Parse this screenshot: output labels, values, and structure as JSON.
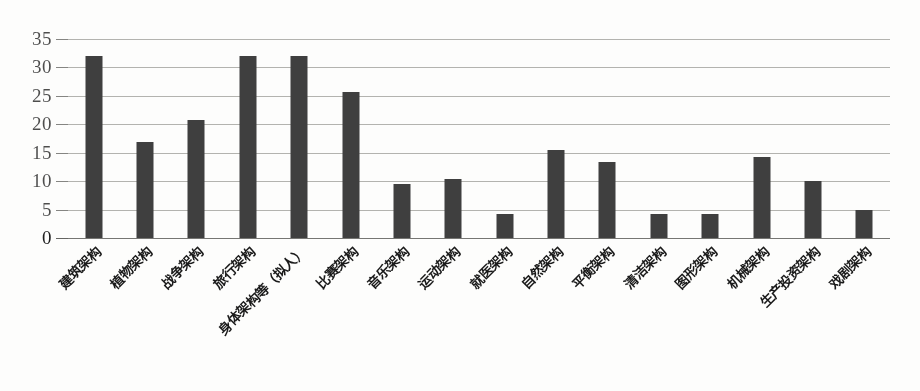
{
  "chart_data": {
    "type": "bar",
    "title": "",
    "xlabel": "",
    "ylabel": "",
    "ylim": [
      0,
      35
    ],
    "yticks": [
      0,
      5,
      10,
      15,
      20,
      25,
      30,
      35
    ],
    "grid": true,
    "legend": "none",
    "bar_color": "#3f3f3f",
    "gridline_color": "#9a9a96",
    "categories": [
      "建筑架构",
      "植物架构",
      "战争架构",
      "旅行架构",
      "身体架构等（拟人）",
      "比赛架构",
      "音乐架构",
      "运动架构",
      "就医架构",
      "自然架构",
      "平衡架构",
      "清洁架构",
      "图形架构",
      "机械架构",
      "生产投资架构",
      "戏剧架构"
    ],
    "values": [
      32,
      16.8,
      20.8,
      32,
      32,
      25.7,
      9.5,
      10.4,
      4.3,
      15.4,
      13.3,
      4.2,
      4.2,
      14.2,
      10.1,
      5.0
    ]
  }
}
